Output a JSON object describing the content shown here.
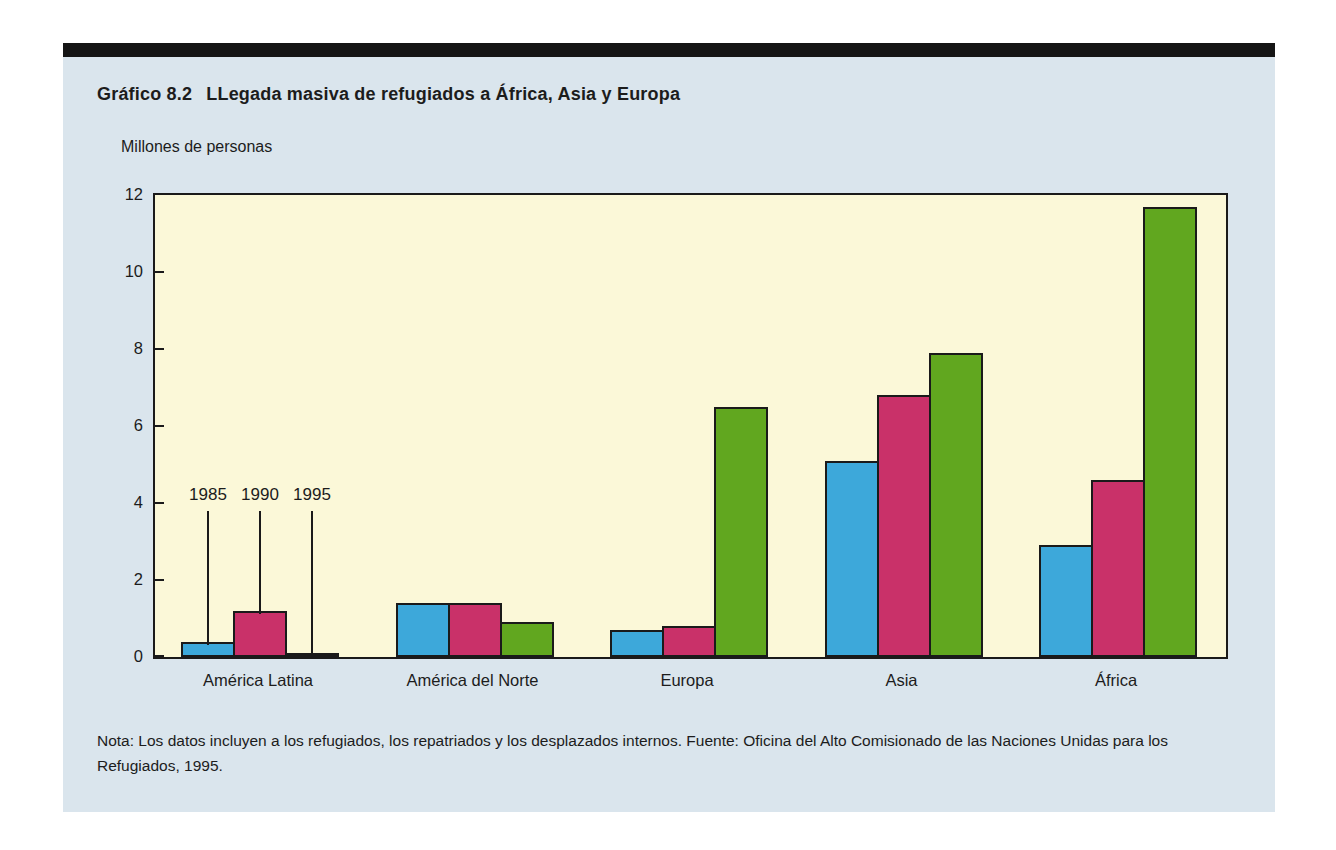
{
  "figure": {
    "top_bar_color": "#151515",
    "panel_color": "#DAE5ED",
    "text_color": "#1c1c1c",
    "title_number": "Gráfico 8.2",
    "title_text": "LLegada masiva de refugiados a África, Asia y Europa",
    "note": "Nota: Los datos incluyen a los refugiados, los repatriados y los desplazados internos. Fuente: Oficina del Alto Comisionado de las Naciones Unidas para los Refugiados, 1995."
  },
  "chart_data": {
    "type": "bar",
    "ylabel": "Millones de personas",
    "xlabel": "",
    "categories": [
      "América Latina",
      "América del Norte",
      "Europa",
      "Asia",
      "África"
    ],
    "series": [
      {
        "name": "1985",
        "color": "#3DA8DA",
        "values": [
          0.4,
          1.4,
          0.7,
          5.1,
          2.9
        ]
      },
      {
        "name": "1990",
        "color": "#C93169",
        "values": [
          1.2,
          1.4,
          0.8,
          6.8,
          4.6
        ]
      },
      {
        "name": "1995",
        "color": "#61A71F",
        "values": [
          0.1,
          0.9,
          6.5,
          7.9,
          11.7
        ]
      }
    ],
    "ylim": [
      0,
      12
    ],
    "yticks": [
      0,
      2,
      4,
      6,
      8,
      10,
      12
    ],
    "grid": false,
    "plot_background": "#FBF8D8",
    "legend": {
      "style": "year-labels-with-leader-lines",
      "above_category": "América Latina",
      "labels": [
        "1985",
        "1990",
        "1995"
      ]
    }
  }
}
